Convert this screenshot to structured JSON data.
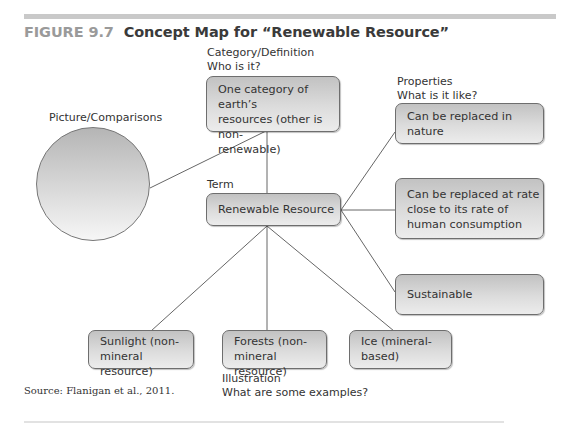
{
  "figure": {
    "number": "FIGURE 9.7",
    "title": "Concept Map for “Renewable Resource”",
    "source": "Source: Flanigan et al., 2011."
  },
  "labels": {
    "category_line1": "Category/Definition",
    "category_line2": "Who is it?",
    "properties_line1": "Properties",
    "properties_line2": "What is it like?",
    "picture": "Picture/Comparisons",
    "term": "Term",
    "illustration_line1": "Illustration",
    "illustration_line2": "What are some examples?"
  },
  "nodes": {
    "definition": [
      "One category of earth’s",
      "resources (other is non-",
      "renewable)"
    ],
    "term": "Renewable Resource",
    "properties": [
      [
        "Can be replaced in",
        "nature"
      ],
      [
        "Can be replaced at rate",
        "close to its rate of",
        "human consumption"
      ],
      [
        "Sustainable"
      ]
    ],
    "examples": [
      [
        "Sunlight (non-",
        "mineral resource)"
      ],
      [
        "Forests (non-",
        "mineral resource)"
      ],
      [
        "Ice (mineral-",
        "based)"
      ]
    ]
  },
  "colors": {
    "node_border": "#6e6e6e",
    "node_fill_top": "#c2c2c2",
    "node_fill_bottom": "#ececec",
    "line": "#666666",
    "figure_number": "#9a9a9a",
    "rule": "#c9c9c9"
  }
}
